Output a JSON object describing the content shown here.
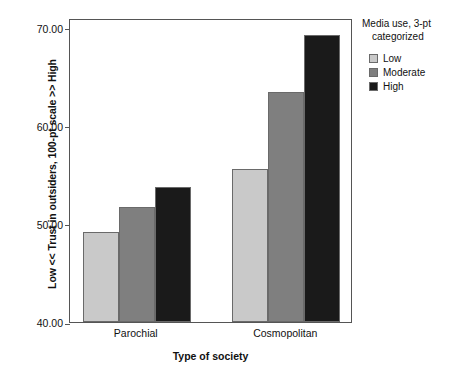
{
  "chart_data": {
    "type": "bar",
    "title": "",
    "xlabel": "Type of society",
    "ylabel": "Low << Trust in outsiders, 100-pt scale >> High",
    "categories": [
      "Parochial",
      "Cosmopolitan"
    ],
    "series": [
      {
        "name": "Low",
        "values": [
          49.2,
          55.6
        ],
        "color": "#c9c9c9"
      },
      {
        "name": "Moderate",
        "values": [
          51.7,
          63.5
        ],
        "color": "#7f7f7f"
      },
      {
        "name": "High",
        "values": [
          53.8,
          69.3
        ],
        "color": "#1a1a1a"
      }
    ],
    "ylim": [
      40.0,
      71.0
    ],
    "yticks": [
      40.0,
      50.0,
      60.0,
      70.0
    ],
    "ytick_labels": [
      "40.00",
      "50.00",
      "60.00",
      "70.00"
    ],
    "grid": false,
    "legend_position": "right",
    "legend_title_line1": "Media use, 3-pt",
    "legend_title_line2": "categorized"
  },
  "axis": {
    "y_title": "Low << Trust in outsiders, 100-pt scale >> High",
    "x_title": "Type of society",
    "ticks": [
      {
        "label": "70.00",
        "value": 70.0
      },
      {
        "label": "60.00",
        "value": 60.0
      },
      {
        "label": "50.00",
        "value": 50.0
      },
      {
        "label": "40.00",
        "value": 40.0
      }
    ]
  },
  "groups": [
    {
      "label": "Parochial"
    },
    {
      "label": "Cosmopolitan"
    }
  ],
  "legend": {
    "title_line1": "Media use, 3-pt",
    "title_line2": "categorized",
    "items": [
      {
        "label": "Low",
        "color": "#c9c9c9"
      },
      {
        "label": "Moderate",
        "color": "#7f7f7f"
      },
      {
        "label": "High",
        "color": "#1a1a1a"
      }
    ]
  }
}
